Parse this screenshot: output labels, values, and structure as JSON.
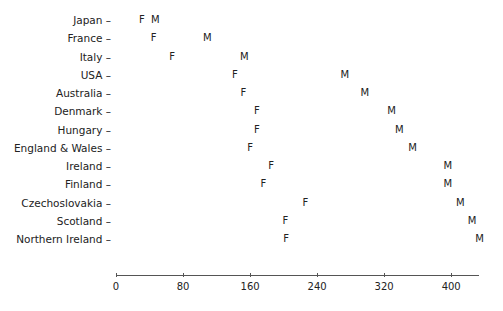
{
  "chart_data": {
    "type": "scatter",
    "title": "",
    "xlabel": "",
    "ylabel": "",
    "xlim": [
      0,
      440
    ],
    "xticks": [
      0,
      80,
      160,
      240,
      320,
      400
    ],
    "grid": false,
    "legend": "none (markers labeled F and M)",
    "marker_labels": {
      "female": "F",
      "male": "M"
    },
    "categories": [
      "Japan",
      "France",
      "Italy",
      "USA",
      "Australia",
      "Denmark",
      "Hungary",
      "England & Wales",
      "Ireland",
      "Finland",
      "Czechoslovakia",
      "Scotland",
      "Northern Ireland"
    ],
    "series": [
      {
        "name": "F",
        "values": [
          31,
          45,
          67,
          142,
          152,
          168,
          168,
          160,
          185,
          176,
          226,
          202,
          203
        ]
      },
      {
        "name": "M",
        "values": [
          47,
          109,
          153,
          273,
          297,
          329,
          338,
          354,
          396,
          396,
          411,
          425,
          434
        ]
      }
    ]
  }
}
